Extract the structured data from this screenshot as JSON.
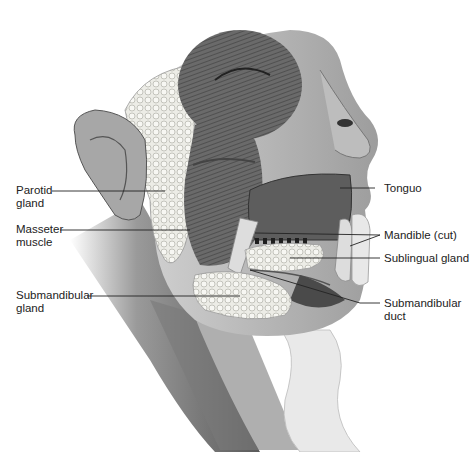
{
  "figure": {
    "labels": {
      "parotid": {
        "line1": "Parotid",
        "line2": "gland"
      },
      "masseter": {
        "line1": "Masseter",
        "line2": "muscle"
      },
      "submandibular_gland": {
        "line1": "Submandibular",
        "line2": "gland"
      },
      "tongue": {
        "line1": "Tonguo"
      },
      "mandible": {
        "line1": "Mandible (cut)"
      },
      "sublingual": {
        "line1": "Sublingual gland"
      },
      "submandibular_duct": {
        "line1": "Submandibular",
        "line2": "duct"
      }
    },
    "colors": {
      "ink": "#222222",
      "shade_dark": "#4a4a4a",
      "shade_mid": "#8a8a8a",
      "shade_light": "#d0d0d0",
      "gland": "#e6e6e0"
    }
  }
}
